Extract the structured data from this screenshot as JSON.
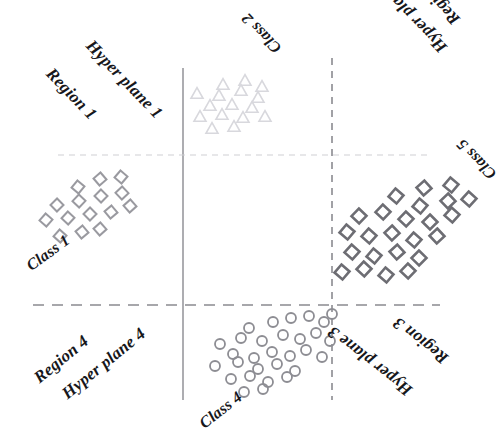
{
  "figure": {
    "background": "#ffffff",
    "width": 496,
    "height": 437
  },
  "colors": {
    "class1_marker": "#9a9aa0",
    "class2_marker": "#d8d8dd",
    "class4_marker": "#8d8d93",
    "class5_marker": "#6d6d73",
    "solid_line": "#8a8a90",
    "dashed_line": "#8a8a90",
    "faint_line": "#cfcfd4",
    "text": "#17171b"
  },
  "labels": [
    {
      "id": "hyper-plane-1",
      "text": "Hyper plane 1",
      "x": 96,
      "y": 36,
      "rotate": 46,
      "size": 17
    },
    {
      "id": "region-1",
      "text": "Region 1",
      "x": 56,
      "y": 64,
      "rotate": 46,
      "size": 17
    },
    {
      "id": "class-2",
      "text": "Class 2",
      "x": 272,
      "y": 57,
      "rotate": 226,
      "size": 16
    },
    {
      "id": "region-2",
      "text": "Region 2",
      "x": 450,
      "y": 29,
      "rotate": 226,
      "size": 17
    },
    {
      "id": "hyper-plane-2",
      "text": "Hyper plane 2",
      "x": 437,
      "y": 57,
      "rotate": 226,
      "size": 17
    },
    {
      "id": "class-5",
      "text": "Class 5",
      "x": 487,
      "y": 183,
      "rotate": 226,
      "size": 16
    },
    {
      "id": "class-1",
      "text": "Class 1",
      "x": 23,
      "y": 260,
      "rotate": -36,
      "size": 16
    },
    {
      "id": "region-4",
      "text": "Region 4",
      "x": 30,
      "y": 372,
      "rotate": -39,
      "size": 17
    },
    {
      "id": "hyper-plane-4",
      "text": "Hyper plane 4",
      "x": 58,
      "y": 388,
      "rotate": -39,
      "size": 17
    },
    {
      "id": "class-4",
      "text": "Class 4",
      "x": 196,
      "y": 418,
      "rotate": -38,
      "size": 16
    },
    {
      "id": "hyper-plane-3",
      "text": "Hyper plane 3",
      "x": 404,
      "y": 400,
      "rotate": 218,
      "size": 17
    },
    {
      "id": "region-3",
      "text": "Region 3",
      "x": 440,
      "y": 368,
      "rotate": 218,
      "size": 17
    }
  ],
  "lines": [
    {
      "id": "hyperplane-1-line",
      "orientation": "vertical",
      "style": "solid",
      "x1": 183,
      "y1": 68,
      "x2": 183,
      "y2": 400,
      "color": "#8a8a90",
      "width": 1.4
    },
    {
      "id": "hyperplane-2-line",
      "orientation": "vertical",
      "style": "dashed",
      "x1": 332,
      "y1": 58,
      "x2": 332,
      "y2": 400,
      "color": "#8a8a90",
      "width": 1.6,
      "dash": "7 6"
    },
    {
      "id": "hyperplane-3-line",
      "orientation": "horizontal",
      "style": "dashed",
      "x1": 33,
      "y1": 305,
      "x2": 440,
      "y2": 305,
      "color": "#8a8a90",
      "width": 1.6,
      "dash": "11 8"
    },
    {
      "id": "hyperplane-4-line",
      "orientation": "horizontal",
      "style": "faint",
      "x1": 58,
      "y1": 155,
      "x2": 432,
      "y2": 155,
      "color": "#cfcfd4",
      "width": 1.2,
      "dash": "6 5"
    }
  ],
  "chart_data": {
    "type": "scatter",
    "xlabel": "",
    "ylabel": "",
    "xlim": [
      0,
      496
    ],
    "ylim": [
      437,
      0
    ],
    "grid": false,
    "legend": "none",
    "annotations": [
      "Hyper plane 1",
      "Region 1",
      "Class 2",
      "Region 2",
      "Hyper plane 2",
      "Class 5",
      "Class 1",
      "Region 4",
      "Hyper plane 4",
      "Class 4",
      "Hyper plane 3",
      "Region 3"
    ],
    "series": [
      {
        "name": "Class 1",
        "marker": "diamond",
        "color": "#9a9aa0",
        "size": 13,
        "region": "Region 1",
        "points": [
          [
            78,
            187
          ],
          [
            100,
            179
          ],
          [
            121,
            177
          ],
          [
            57,
            205
          ],
          [
            79,
            201
          ],
          [
            101,
            196
          ],
          [
            122,
            193
          ],
          [
            46,
            220
          ],
          [
            68,
            218
          ],
          [
            90,
            214
          ],
          [
            111,
            212
          ],
          [
            130,
            206
          ],
          [
            60,
            236
          ],
          [
            82,
            232
          ],
          [
            100,
            229
          ]
        ]
      },
      {
        "name": "Class 2",
        "marker": "triangle",
        "color": "#d8d8dd",
        "size": 12,
        "region": "Region 2",
        "points": [
          [
            223,
            84
          ],
          [
            245,
            80
          ],
          [
            262,
            86
          ],
          [
            197,
            93
          ],
          [
            219,
            95
          ],
          [
            241,
            90
          ],
          [
            258,
            97
          ],
          [
            210,
            105
          ],
          [
            232,
            104
          ],
          [
            252,
            107
          ],
          [
            200,
            116
          ],
          [
            222,
            114
          ],
          [
            243,
            117
          ],
          [
            265,
            116
          ],
          [
            212,
            128
          ],
          [
            234,
            126
          ]
        ]
      },
      {
        "name": "Class 5",
        "marker": "diamond",
        "color": "#6d6d73",
        "size": 15,
        "region": "Region 2 / Region 3 boundary",
        "points": [
          [
            424,
            188
          ],
          [
            451,
            185
          ],
          [
            396,
            196
          ],
          [
            420,
            206
          ],
          [
            448,
            201
          ],
          [
            469,
            199
          ],
          [
            359,
            216
          ],
          [
            383,
            212
          ],
          [
            406,
            219
          ],
          [
            430,
            222
          ],
          [
            452,
            215
          ],
          [
            347,
            232
          ],
          [
            369,
            236
          ],
          [
            392,
            233
          ],
          [
            414,
            240
          ],
          [
            437,
            236
          ],
          [
            352,
            252
          ],
          [
            374,
            256
          ],
          [
            397,
            252
          ],
          [
            419,
            258
          ],
          [
            342,
            272
          ],
          [
            364,
            269
          ],
          [
            386,
            275
          ],
          [
            408,
            271
          ]
        ]
      },
      {
        "name": "Class 4",
        "marker": "circle",
        "color": "#8d8d93",
        "size": 10,
        "region": "Region 3 / Region 4 boundary",
        "points": [
          [
            249,
            328
          ],
          [
            273,
            322
          ],
          [
            291,
            318
          ],
          [
            309,
            316
          ],
          [
            324,
            322
          ],
          [
            332,
            314
          ],
          [
            220,
            344
          ],
          [
            241,
            338
          ],
          [
            262,
            341
          ],
          [
            283,
            335
          ],
          [
            300,
            339
          ],
          [
            316,
            333
          ],
          [
            330,
            341
          ],
          [
            233,
            354
          ],
          [
            254,
            358
          ],
          [
            272,
            352
          ],
          [
            290,
            356
          ],
          [
            306,
            350
          ],
          [
            322,
            357
          ],
          [
            215,
            366
          ],
          [
            238,
            362
          ],
          [
            258,
            369
          ],
          [
            277,
            364
          ],
          [
            295,
            371
          ],
          [
            231,
            379
          ],
          [
            250,
            376
          ],
          [
            268,
            382
          ],
          [
            287,
            377
          ],
          [
            244,
            392
          ],
          [
            263,
            389
          ]
        ]
      }
    ]
  }
}
